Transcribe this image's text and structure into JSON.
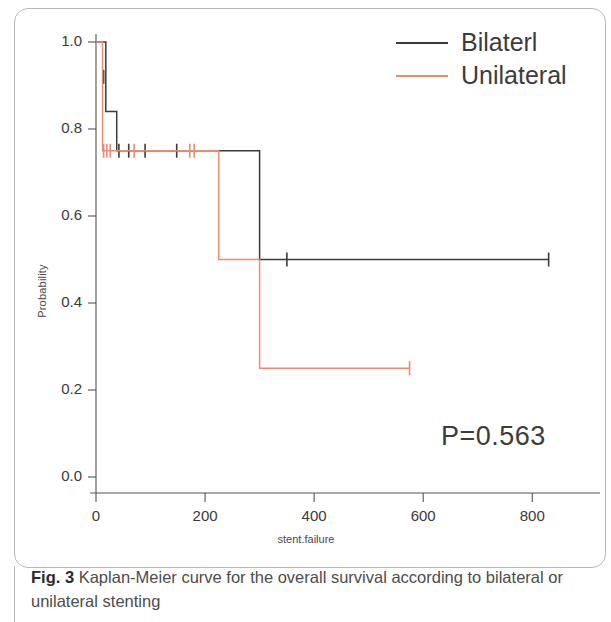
{
  "figure": {
    "caption_lead": "Fig. 3",
    "caption_body": " Kaplan-Meier curve for the overall survival according to bilateral or unilateral stenting",
    "annotation": "P=0.563"
  },
  "legend": {
    "position": "top-right",
    "entries": [
      {
        "label": "Bilaterl",
        "color": "#3b3b3b"
      },
      {
        "label": "Unilateral",
        "color": "#ea8c72"
      }
    ]
  },
  "chart_data": {
    "type": "line",
    "subtype": "kaplan-meier-step",
    "title": "",
    "xlabel": "stent.failure",
    "ylabel": "Probability",
    "xlim": [
      0,
      860
    ],
    "ylim": [
      0.0,
      1.0
    ],
    "xticks": [
      0,
      200,
      400,
      600,
      800
    ],
    "xtick_labels": [
      "0",
      "200",
      "400",
      "600",
      "800"
    ],
    "yticks": [
      0.0,
      0.2,
      0.4,
      0.6,
      0.8,
      1.0
    ],
    "ytick_labels": [
      "0.0",
      "0.2",
      "0.4",
      "0.6",
      "0.8",
      "1.0"
    ],
    "grid": false,
    "legend_position": "top-right",
    "annotations": [
      {
        "text": "P=0.563",
        "x": 620,
        "y": 0.12
      }
    ],
    "series": [
      {
        "name": "Bilaterl",
        "color": "#3b3b3b",
        "steps": [
          {
            "x": 0,
            "y": 1.0
          },
          {
            "x": 18,
            "y": 0.84
          },
          {
            "x": 38,
            "y": 0.75
          },
          {
            "x": 300,
            "y": 0.5
          },
          {
            "x": 830,
            "y": 0.5
          }
        ],
        "censored": [
          {
            "x": 14,
            "y": 0.92
          },
          {
            "x": 42,
            "y": 0.75
          },
          {
            "x": 60,
            "y": 0.75
          },
          {
            "x": 90,
            "y": 0.75
          },
          {
            "x": 148,
            "y": 0.75
          },
          {
            "x": 350,
            "y": 0.5
          },
          {
            "x": 830,
            "y": 0.5
          }
        ]
      },
      {
        "name": "Unilateral",
        "color": "#ea8c72",
        "steps": [
          {
            "x": 0,
            "y": 1.0
          },
          {
            "x": 12,
            "y": 0.75
          },
          {
            "x": 225,
            "y": 0.5
          },
          {
            "x": 300,
            "y": 0.25
          },
          {
            "x": 575,
            "y": 0.25
          }
        ],
        "censored": [
          {
            "x": 14,
            "y": 0.75
          },
          {
            "x": 20,
            "y": 0.75
          },
          {
            "x": 26,
            "y": 0.75
          },
          {
            "x": 70,
            "y": 0.75
          },
          {
            "x": 172,
            "y": 0.75
          },
          {
            "x": 180,
            "y": 0.75
          },
          {
            "x": 575,
            "y": 0.25
          }
        ]
      }
    ]
  }
}
